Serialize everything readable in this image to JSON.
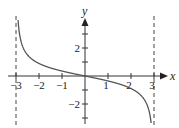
{
  "chart_data": {
    "type": "line",
    "title": "",
    "xlabel": "x",
    "ylabel": "y",
    "xlim": [
      -3.5,
      3.3
    ],
    "ylim": [
      -3.3,
      4.0
    ],
    "grid": false,
    "x_ticks": [
      -3,
      -2,
      -1,
      1,
      2,
      3
    ],
    "x_tick_labels": [
      "−3",
      "−2",
      "−1",
      "1",
      "2",
      "3"
    ],
    "y_ticks": [
      -3,
      -2,
      -1,
      1,
      2,
      3
    ],
    "y_tick_labels": [
      "",
      "−2",
      "",
      "",
      "2",
      ""
    ],
    "asymptotes": [
      {
        "type": "vertical",
        "x": -3,
        "style": "dashed"
      },
      {
        "type": "vertical",
        "x": 3,
        "style": "dashed"
      }
    ],
    "series": [
      {
        "name": "curve",
        "function": "decreasing, vertical asymptotes at x = ±3, passes through origin",
        "x": [
          -2.91,
          -2.8,
          -2.5,
          -2.0,
          -1.5,
          -1.0,
          -0.5,
          0,
          0.5,
          1.0,
          1.5,
          2.0,
          2.5,
          2.8,
          2.93
        ],
        "y": [
          4.0,
          2.6,
          1.51,
          0.89,
          0.58,
          0.35,
          0.17,
          0,
          -0.17,
          -0.35,
          -0.58,
          -0.89,
          -1.51,
          -2.6,
          -3.3
        ]
      }
    ]
  },
  "labels": {
    "x_axis": "x",
    "y_axis": "y",
    "x_ticks": [
      "−3",
      "−2",
      "−1",
      "1",
      "2",
      "3"
    ],
    "y_tick_pos2": "2",
    "y_tick_neg2": "−2"
  },
  "colors": {
    "curve": "#555555",
    "axes": "#333333",
    "asymptote": "#444444"
  }
}
